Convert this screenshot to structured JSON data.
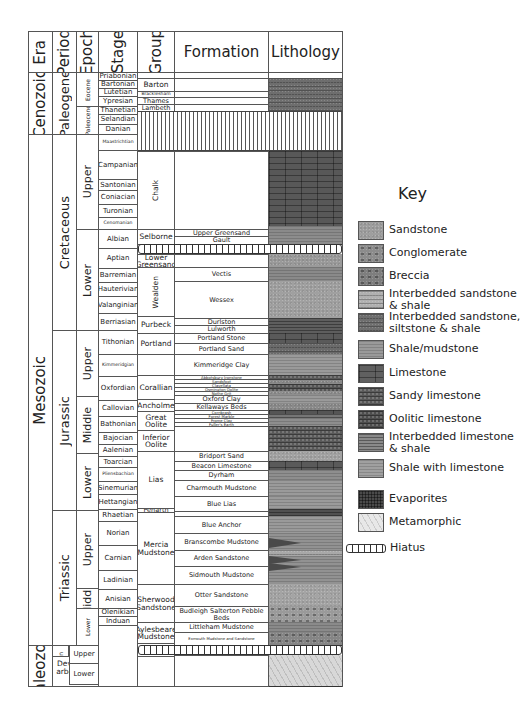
{
  "headers": {
    "era": "Era",
    "period": "Period",
    "epoch": "Epoch",
    "stage": "Stage",
    "group": "Group",
    "formation": "Formation",
    "lithology": "Lithology"
  },
  "eras": [
    {
      "label": "Cenozoic",
      "top": 72,
      "bottom": 134
    },
    {
      "label": "Mesozoic",
      "top": 134,
      "bottom": 645
    },
    {
      "label": "Paleozoic",
      "top": 645,
      "bottom": 686
    }
  ],
  "periods": [
    {
      "label": "Paleogene",
      "top": 72,
      "bottom": 134
    },
    {
      "label": "Cretaceous",
      "top": 134,
      "bottom": 330
    },
    {
      "label": "Jurassic",
      "top": 330,
      "bottom": 510
    },
    {
      "label": "Triassic",
      "top": 510,
      "bottom": 645
    },
    {
      "label": "Permian",
      "top": 645,
      "bottom": 656
    },
    {
      "label": "Devono-Carboniferous",
      "top": 656,
      "bottom": 686
    }
  ],
  "epochs": [
    {
      "label": "Eocene",
      "top": 72,
      "bottom": 106,
      "small": true
    },
    {
      "label": "Paleocene",
      "top": 106,
      "bottom": 134,
      "small": true
    },
    {
      "label": "Upper",
      "top": 134,
      "bottom": 229
    },
    {
      "label": "Lower",
      "top": 229,
      "bottom": 330
    },
    {
      "label": "Upper",
      "top": 330,
      "bottom": 396
    },
    {
      "label": "Middle",
      "top": 396,
      "bottom": 453
    },
    {
      "label": "Lower",
      "top": 453,
      "bottom": 510
    },
    {
      "label": "Upper",
      "top": 510,
      "bottom": 588
    },
    {
      "label": "Middle",
      "top": 588,
      "bottom": 608
    },
    {
      "label": "Lower",
      "top": 608,
      "bottom": 645,
      "small": true
    },
    {
      "label": "Upper",
      "top": 645,
      "bottom": 656
    },
    {
      "label": "Lower",
      "top": 656,
      "bottom": 656
    }
  ],
  "permian_epochs": [
    {
      "label": "Upper",
      "top": 645,
      "bottom": 663
    },
    {
      "label": "Lower",
      "top": 663,
      "bottom": 684
    }
  ],
  "stages": [
    {
      "label": "Priabonian",
      "top": 72,
      "bottom": 80
    },
    {
      "label": "Bartonian",
      "top": 80,
      "bottom": 88
    },
    {
      "label": "Lutetian",
      "top": 88,
      "bottom": 96
    },
    {
      "label": "Ypresian",
      "top": 96,
      "bottom": 106
    },
    {
      "label": "Thanetian",
      "top": 106,
      "bottom": 114
    },
    {
      "label": "Selandian",
      "top": 114,
      "bottom": 124
    },
    {
      "label": "Danian",
      "top": 124,
      "bottom": 134
    },
    {
      "label": "Maastrichtian",
      "top": 134,
      "bottom": 150,
      "small": true
    },
    {
      "label": "Campanian",
      "top": 150,
      "bottom": 179
    },
    {
      "label": "Santonian",
      "top": 179,
      "bottom": 190
    },
    {
      "label": "Coniacian",
      "top": 190,
      "bottom": 204
    },
    {
      "label": "Turonian",
      "top": 204,
      "bottom": 217
    },
    {
      "label": "Cenomanian",
      "top": 217,
      "bottom": 229,
      "small": true
    },
    {
      "label": "Albian",
      "top": 229,
      "bottom": 248
    },
    {
      "label": "Aptian",
      "top": 248,
      "bottom": 268
    },
    {
      "label": "Barremian",
      "top": 268,
      "bottom": 282
    },
    {
      "label": "Hauterivian",
      "top": 282,
      "bottom": 296
    },
    {
      "label": "Valanginian",
      "top": 296,
      "bottom": 313
    },
    {
      "label": "Berriasian",
      "top": 313,
      "bottom": 330
    },
    {
      "label": "Tithonian",
      "top": 330,
      "bottom": 354
    },
    {
      "label": "Kimmeridgian",
      "top": 354,
      "bottom": 376,
      "small": true
    },
    {
      "label": "Oxfordian",
      "top": 376,
      "bottom": 400
    },
    {
      "label": "Callovian",
      "top": 400,
      "bottom": 416
    },
    {
      "label": "Bathonian",
      "top": 416,
      "bottom": 432
    },
    {
      "label": "Bajocian",
      "top": 432,
      "bottom": 444
    },
    {
      "label": "Aalenian",
      "top": 444,
      "bottom": 456
    },
    {
      "label": "Toarcian",
      "top": 456,
      "bottom": 467
    },
    {
      "label": "Pliensbachian",
      "top": 467,
      "bottom": 481,
      "small": true
    },
    {
      "label": "Sinemurian",
      "top": 481,
      "bottom": 494
    },
    {
      "label": "Hettangian",
      "top": 494,
      "bottom": 509
    },
    {
      "label": "Rhaetian",
      "top": 509,
      "bottom": 521
    },
    {
      "label": "Norian",
      "top": 521,
      "bottom": 545
    },
    {
      "label": "Carnian",
      "top": 545,
      "bottom": 570
    },
    {
      "label": "Ladinian",
      "top": 570,
      "bottom": 589
    },
    {
      "label": "Anisian",
      "top": 589,
      "bottom": 608
    },
    {
      "label": "Olenikian",
      "top": 608,
      "bottom": 616
    },
    {
      "label": "Induan",
      "top": 616,
      "bottom": 625
    }
  ],
  "groups": [
    {
      "label": "Barton",
      "top": 78,
      "bottom": 91
    },
    {
      "label": "Bracklesham",
      "top": 91,
      "bottom": 97,
      "small": true
    },
    {
      "label": "Thames",
      "top": 97,
      "bottom": 104
    },
    {
      "label": "Lambeth",
      "top": 104,
      "bottom": 111
    },
    {
      "label": "Chalk",
      "top": 151,
      "bottom": 229,
      "vertical": true
    },
    {
      "label": "Selborne",
      "top": 229,
      "bottom": 244
    },
    {
      "label": "Lower Greensand",
      "top": 254,
      "bottom": 267
    },
    {
      "label": "Wealden",
      "top": 267,
      "bottom": 316,
      "vertical": true
    },
    {
      "label": "Purbeck",
      "top": 316,
      "bottom": 333
    },
    {
      "label": "Portland",
      "top": 333,
      "bottom": 354
    },
    {
      "label": "Corallian",
      "top": 375,
      "bottom": 399
    },
    {
      "label": "Ancholme",
      "top": 399,
      "bottom": 411
    },
    {
      "label": "Great Oolite",
      "top": 411,
      "bottom": 430
    },
    {
      "label": "Inferior Oolite",
      "top": 430,
      "bottom": 451
    },
    {
      "label": "Lias",
      "top": 451,
      "bottom": 508
    },
    {
      "label": "Penarth",
      "top": 508,
      "bottom": 512
    },
    {
      "label": "Mercia Mudstone",
      "top": 512,
      "bottom": 584
    },
    {
      "label": "Sherwood Sandstone",
      "top": 584,
      "bottom": 622
    },
    {
      "label": "Aylesbeare Mudstone",
      "top": 622,
      "bottom": 643
    },
    {
      "label": "Exeter",
      "top": 643,
      "bottom": 656
    }
  ],
  "formations": [
    {
      "label": "",
      "top": 72,
      "bottom": 78
    },
    {
      "label": "",
      "top": 78,
      "bottom": 91
    },
    {
      "label": "",
      "top": 91,
      "bottom": 97
    },
    {
      "label": "",
      "top": 97,
      "bottom": 104
    },
    {
      "label": "",
      "top": 104,
      "bottom": 111
    },
    {
      "label": "",
      "top": 151,
      "bottom": 229
    },
    {
      "label": "Upper Greensand",
      "top": 229,
      "bottom": 236
    },
    {
      "label": "Gault",
      "top": 236,
      "bottom": 244
    },
    {
      "label": "",
      "top": 254,
      "bottom": 267
    },
    {
      "label": "Vectis",
      "top": 267,
      "bottom": 281
    },
    {
      "label": "Wessex",
      "top": 281,
      "bottom": 318
    },
    {
      "label": "Durlston",
      "top": 318,
      "bottom": 325
    },
    {
      "label": "Lulworth",
      "top": 325,
      "bottom": 333
    },
    {
      "label": "Portland Stone",
      "top": 333,
      "bottom": 343
    },
    {
      "label": "Portland Sand",
      "top": 343,
      "bottom": 354
    },
    {
      "label": "Kimmeridge Clay",
      "top": 354,
      "bottom": 375
    },
    {
      "label": "Abbotsbury Ironstone",
      "top": 375,
      "bottom": 379,
      "small": true
    },
    {
      "label": "Sandsfoot",
      "top": 379,
      "bottom": 383,
      "small": true
    },
    {
      "label": "Clavellata",
      "top": 383,
      "bottom": 387,
      "small": true
    },
    {
      "label": "Osmington Oolite",
      "top": 387,
      "bottom": 391,
      "small": true
    },
    {
      "label": "Nothe Grit",
      "top": 391,
      "bottom": 395,
      "small": true
    },
    {
      "label": "Oxford Clay",
      "top": 395,
      "bottom": 403
    },
    {
      "label": "Kellaways Beds",
      "top": 403,
      "bottom": 410
    },
    {
      "label": "Cornbrash",
      "top": 410,
      "bottom": 414,
      "small": true
    },
    {
      "label": "Forest Marble",
      "top": 414,
      "bottom": 418,
      "small": true
    },
    {
      "label": "Frome Clay",
      "top": 418,
      "bottom": 422,
      "small": true
    },
    {
      "label": "Fuller's Earth",
      "top": 422,
      "bottom": 426,
      "small": true
    },
    {
      "label": "",
      "top": 426,
      "bottom": 451
    },
    {
      "label": "Bridport Sand",
      "top": 451,
      "bottom": 461
    },
    {
      "label": "Beacon Limestone",
      "top": 461,
      "bottom": 470
    },
    {
      "label": "Dyrham",
      "top": 470,
      "bottom": 480
    },
    {
      "label": "Charmouth Mudstone",
      "top": 480,
      "bottom": 496
    },
    {
      "label": "Blue Lias",
      "top": 496,
      "bottom": 511
    },
    {
      "label": "",
      "top": 511,
      "bottom": 516
    },
    {
      "label": "Blue Anchor",
      "top": 516,
      "bottom": 533
    },
    {
      "label": "Branscombe Mudstone",
      "top": 533,
      "bottom": 550
    },
    {
      "label": "Arden Sandstone",
      "top": 550,
      "bottom": 566
    },
    {
      "label": "Sidmouth Mudstone",
      "top": 566,
      "bottom": 584
    },
    {
      "label": "Otter Sandstone",
      "top": 584,
      "bottom": 606
    },
    {
      "label": "Budleigh Salterton Pebble Beds",
      "top": 606,
      "bottom": 622
    },
    {
      "label": "Littleham Mudstone",
      "top": 622,
      "bottom": 632
    },
    {
      "label": "Exmouth Mudstone and Sandstone",
      "top": 632,
      "bottom": 645,
      "small": true
    },
    {
      "label": "",
      "top": 645,
      "bottom": 655
    }
  ],
  "lithology": [
    {
      "top": 78,
      "bottom": 111,
      "type": "interbedded-sandstone-siltstone-shale",
      "color": "#6e6e6e"
    },
    {
      "top": 151,
      "bottom": 226,
      "type": "limestone",
      "color": "#585858"
    },
    {
      "top": 226,
      "bottom": 235,
      "type": "shale-with-limestone",
      "color": "#8a8a8a"
    },
    {
      "top": 235,
      "bottom": 244,
      "type": "shale-mudstone",
      "color": "#8d8d8d"
    },
    {
      "top": 254,
      "bottom": 267,
      "type": "sandstone",
      "color": "#9a9a9a"
    },
    {
      "top": 267,
      "bottom": 281,
      "type": "shale-mudstone",
      "color": "#8a8a8a"
    },
    {
      "top": 281,
      "bottom": 318,
      "type": "sandstone",
      "color": "#a0a0a0"
    },
    {
      "top": 318,
      "bottom": 333,
      "type": "interbedded-limestone-shale",
      "color": "#5e5e5e"
    },
    {
      "top": 333,
      "bottom": 343,
      "type": "limestone",
      "color": "#5a5a5a"
    },
    {
      "top": 343,
      "bottom": 354,
      "type": "interbedded-sandstone-shale",
      "color": "#6a6a6a"
    },
    {
      "top": 354,
      "bottom": 375,
      "type": "shale-mudstone",
      "color": "#9a9a9a"
    },
    {
      "top": 375,
      "bottom": 380,
      "type": "sandy-limestone",
      "color": "#5a5a5a"
    },
    {
      "top": 380,
      "bottom": 384,
      "type": "sandstone",
      "color": "#8a8a8a"
    },
    {
      "top": 384,
      "bottom": 391,
      "type": "oolitic-limestone",
      "color": "#555555"
    },
    {
      "top": 391,
      "bottom": 395,
      "type": "sandstone",
      "color": "#8e8e8e"
    },
    {
      "top": 395,
      "bottom": 403,
      "type": "shale-mudstone",
      "color": "#9a9a9a"
    },
    {
      "top": 403,
      "bottom": 410,
      "type": "sandstone",
      "color": "#8a8a8a"
    },
    {
      "top": 410,
      "bottom": 414,
      "type": "limestone",
      "color": "#555555"
    },
    {
      "top": 414,
      "bottom": 418,
      "type": "interbedded-limestone-shale",
      "color": "#767676"
    },
    {
      "top": 418,
      "bottom": 426,
      "type": "shale-mudstone",
      "color": "#8e8e8e"
    },
    {
      "top": 426,
      "bottom": 451,
      "type": "oolitic-limestone",
      "color": "#5a5a5a"
    },
    {
      "top": 451,
      "bottom": 461,
      "type": "sandstone",
      "color": "#a2a2a2"
    },
    {
      "top": 461,
      "bottom": 470,
      "type": "limestone",
      "color": "#5a5a5a"
    },
    {
      "top": 470,
      "bottom": 480,
      "type": "shale-mudstone",
      "color": "#8e8e8e"
    },
    {
      "top": 480,
      "bottom": 496,
      "type": "shale-mudstone",
      "color": "#9a9a9a"
    },
    {
      "top": 496,
      "bottom": 509,
      "type": "shale-with-limestone",
      "color": "#9a9a9a"
    },
    {
      "top": 509,
      "bottom": 516,
      "type": "interbedded-limestone-shale",
      "color": "#505050"
    },
    {
      "top": 516,
      "bottom": 533,
      "type": "shale-mudstone",
      "color": "#9a9a9a"
    },
    {
      "top": 533,
      "bottom": 550,
      "type": "shale-mudstone",
      "color": "#929292"
    },
    {
      "top": 550,
      "bottom": 556,
      "type": "interbedded-sandstone-shale",
      "color": "#a8a8a8"
    },
    {
      "top": 556,
      "bottom": 566,
      "type": "shale-mudstone",
      "color": "#929292"
    },
    {
      "top": 566,
      "bottom": 584,
      "type": "shale-mudstone",
      "color": "#929292"
    },
    {
      "top": 584,
      "bottom": 606,
      "type": "sandstone",
      "color": "#a4a4a4"
    },
    {
      "top": 606,
      "bottom": 622,
      "type": "conglomerate",
      "color": "#9a9a9a"
    },
    {
      "top": 622,
      "bottom": 632,
      "type": "shale-mudstone",
      "color": "#8a8a8a"
    },
    {
      "top": 632,
      "bottom": 645,
      "type": "breccia",
      "color": "#858585"
    },
    {
      "top": 655,
      "bottom": 686,
      "type": "metamorphic",
      "color": "#d8d8d8"
    }
  ],
  "hiatuses": [
    {
      "top": 111,
      "bottom": 151,
      "kind": "wide"
    },
    {
      "top": 244,
      "bottom": 254,
      "kind": "thin"
    },
    {
      "top": 645,
      "bottom": 655,
      "kind": "thin"
    }
  ],
  "wedges": [
    {
      "top": 538,
      "height": 10,
      "color": "#4a4a4a"
    },
    {
      "top": 556,
      "height": 8,
      "color": "#4a4a4a"
    },
    {
      "top": 563,
      "height": 8,
      "color": "#4a4a4a"
    }
  ],
  "key": {
    "title": "Key",
    "items": [
      {
        "label": "Sandstone",
        "color": "#9e9e9e",
        "top": 221
      },
      {
        "label": "Conglomerate",
        "color": "#8c8c8c",
        "top": 244
      },
      {
        "label": "Breccia",
        "color": "#7e7e7e",
        "top": 267
      },
      {
        "label": "Interbedded sandstone\n& shale",
        "color": "#b0b0b0",
        "top": 290
      },
      {
        "label": "Interbedded sandstone,\nsiltstone & shale",
        "color": "#6f6f6f",
        "top": 313
      },
      {
        "label": "Shale/mudstone",
        "color": "#9a9a9a",
        "top": 340
      },
      {
        "label": "Limestone",
        "color": "#606060",
        "top": 364
      },
      {
        "label": "Sandy limestone",
        "color": "#5a5a5a",
        "top": 387
      },
      {
        "label": "Oolitic limestone",
        "color": "#4e4e4e",
        "top": 410
      },
      {
        "label": "Interbedded limestone\n& shale",
        "color": "#8a8a8a",
        "top": 433
      },
      {
        "label": "Shale with limestone",
        "color": "#a0a0a0",
        "top": 459
      },
      {
        "label": "Evaporites",
        "color": "#4a4a4a",
        "top": 490
      },
      {
        "label": "Metamorphic",
        "color": "#e8e8e8",
        "top": 513
      }
    ],
    "hiatus_label": "Hiatus"
  }
}
